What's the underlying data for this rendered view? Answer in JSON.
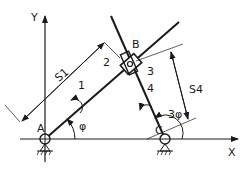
{
  "diagram": {
    "type": "slider-crank linkage",
    "axes": {
      "x_label": "X",
      "y_label": "Y"
    },
    "points": {
      "A": "A",
      "B": "B",
      "C": "C"
    },
    "links": {
      "l1": "1",
      "l2": "2",
      "l3": "3",
      "l4": "4"
    },
    "dimensions": {
      "s1": "S1",
      "s4": "S4"
    },
    "angles": {
      "phi": "φ",
      "three_phi": "3φ"
    },
    "colors": {
      "line": "#1a1a1a",
      "background": "#ffffff"
    }
  }
}
